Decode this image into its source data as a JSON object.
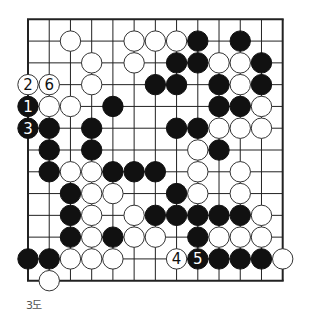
{
  "diagram": {
    "type": "go-board-fragment",
    "caption": "3도",
    "grid": {
      "cols": 13,
      "rows": 13
    },
    "colors": {
      "line": "#222222",
      "black": "#111111",
      "white": "#ffffff",
      "caption": "#555555"
    },
    "stones": [
      {
        "row": 1,
        "col": 2,
        "color": "W"
      },
      {
        "row": 1,
        "col": 5,
        "color": "W"
      },
      {
        "row": 1,
        "col": 6,
        "color": "W"
      },
      {
        "row": 1,
        "col": 7,
        "color": "W"
      },
      {
        "row": 1,
        "col": 8,
        "color": "B"
      },
      {
        "row": 1,
        "col": 10,
        "color": "B"
      },
      {
        "row": 2,
        "col": 3,
        "color": "W"
      },
      {
        "row": 2,
        "col": 5,
        "color": "W"
      },
      {
        "row": 2,
        "col": 7,
        "color": "B"
      },
      {
        "row": 2,
        "col": 8,
        "color": "B"
      },
      {
        "row": 2,
        "col": 9,
        "color": "W"
      },
      {
        "row": 2,
        "col": 10,
        "color": "W"
      },
      {
        "row": 2,
        "col": 11,
        "color": "B"
      },
      {
        "row": 3,
        "col": 0,
        "color": "W",
        "label": "2"
      },
      {
        "row": 3,
        "col": 1,
        "color": "W",
        "label": "6"
      },
      {
        "row": 3,
        "col": 3,
        "color": "W"
      },
      {
        "row": 3,
        "col": 6,
        "color": "B"
      },
      {
        "row": 3,
        "col": 7,
        "color": "B"
      },
      {
        "row": 3,
        "col": 9,
        "color": "B"
      },
      {
        "row": 3,
        "col": 10,
        "color": "W"
      },
      {
        "row": 3,
        "col": 11,
        "color": "B"
      },
      {
        "row": 4,
        "col": 0,
        "color": "B",
        "label": "1"
      },
      {
        "row": 4,
        "col": 1,
        "color": "W"
      },
      {
        "row": 4,
        "col": 2,
        "color": "W"
      },
      {
        "row": 4,
        "col": 4,
        "color": "B"
      },
      {
        "row": 4,
        "col": 9,
        "color": "B"
      },
      {
        "row": 4,
        "col": 10,
        "color": "B"
      },
      {
        "row": 4,
        "col": 11,
        "color": "W"
      },
      {
        "row": 5,
        "col": 0,
        "color": "B",
        "label": "3"
      },
      {
        "row": 5,
        "col": 1,
        "color": "B"
      },
      {
        "row": 5,
        "col": 3,
        "color": "B"
      },
      {
        "row": 5,
        "col": 7,
        "color": "B"
      },
      {
        "row": 5,
        "col": 8,
        "color": "B"
      },
      {
        "row": 5,
        "col": 9,
        "color": "W"
      },
      {
        "row": 5,
        "col": 10,
        "color": "W"
      },
      {
        "row": 5,
        "col": 11,
        "color": "W"
      },
      {
        "row": 6,
        "col": 1,
        "color": "B"
      },
      {
        "row": 6,
        "col": 3,
        "color": "B"
      },
      {
        "row": 6,
        "col": 8,
        "color": "W"
      },
      {
        "row": 6,
        "col": 9,
        "color": "B"
      },
      {
        "row": 7,
        "col": 1,
        "color": "B"
      },
      {
        "row": 7,
        "col": 2,
        "color": "W"
      },
      {
        "row": 7,
        "col": 3,
        "color": "W"
      },
      {
        "row": 7,
        "col": 4,
        "color": "B"
      },
      {
        "row": 7,
        "col": 5,
        "color": "B"
      },
      {
        "row": 7,
        "col": 6,
        "color": "B"
      },
      {
        "row": 7,
        "col": 8,
        "color": "W"
      },
      {
        "row": 7,
        "col": 10,
        "color": "W"
      },
      {
        "row": 8,
        "col": 2,
        "color": "B"
      },
      {
        "row": 8,
        "col": 3,
        "color": "W"
      },
      {
        "row": 8,
        "col": 4,
        "color": "W"
      },
      {
        "row": 8,
        "col": 7,
        "color": "B"
      },
      {
        "row": 8,
        "col": 8,
        "color": "W"
      },
      {
        "row": 8,
        "col": 10,
        "color": "W"
      },
      {
        "row": 9,
        "col": 2,
        "color": "B"
      },
      {
        "row": 9,
        "col": 3,
        "color": "W"
      },
      {
        "row": 9,
        "col": 5,
        "color": "W"
      },
      {
        "row": 9,
        "col": 6,
        "color": "B"
      },
      {
        "row": 9,
        "col": 7,
        "color": "B"
      },
      {
        "row": 9,
        "col": 8,
        "color": "B"
      },
      {
        "row": 9,
        "col": 9,
        "color": "B"
      },
      {
        "row": 9,
        "col": 10,
        "color": "B"
      },
      {
        "row": 9,
        "col": 11,
        "color": "W"
      },
      {
        "row": 10,
        "col": 2,
        "color": "B"
      },
      {
        "row": 10,
        "col": 3,
        "color": "W"
      },
      {
        "row": 10,
        "col": 4,
        "color": "B"
      },
      {
        "row": 10,
        "col": 5,
        "color": "W"
      },
      {
        "row": 10,
        "col": 6,
        "color": "W"
      },
      {
        "row": 10,
        "col": 8,
        "color": "B"
      },
      {
        "row": 10,
        "col": 9,
        "color": "W"
      },
      {
        "row": 10,
        "col": 10,
        "color": "W"
      },
      {
        "row": 10,
        "col": 11,
        "color": "W"
      },
      {
        "row": 11,
        "col": 0,
        "color": "B"
      },
      {
        "row": 11,
        "col": 1,
        "color": "B"
      },
      {
        "row": 11,
        "col": 2,
        "color": "W"
      },
      {
        "row": 11,
        "col": 3,
        "color": "W"
      },
      {
        "row": 11,
        "col": 4,
        "color": "W"
      },
      {
        "row": 11,
        "col": 7,
        "color": "W",
        "label": "4"
      },
      {
        "row": 11,
        "col": 8,
        "color": "B",
        "label": "5"
      },
      {
        "row": 11,
        "col": 9,
        "color": "B"
      },
      {
        "row": 11,
        "col": 10,
        "color": "B"
      },
      {
        "row": 11,
        "col": 11,
        "color": "B"
      },
      {
        "row": 11,
        "col": 12,
        "color": "W"
      },
      {
        "row": 12,
        "col": 1,
        "color": "W"
      }
    ]
  }
}
